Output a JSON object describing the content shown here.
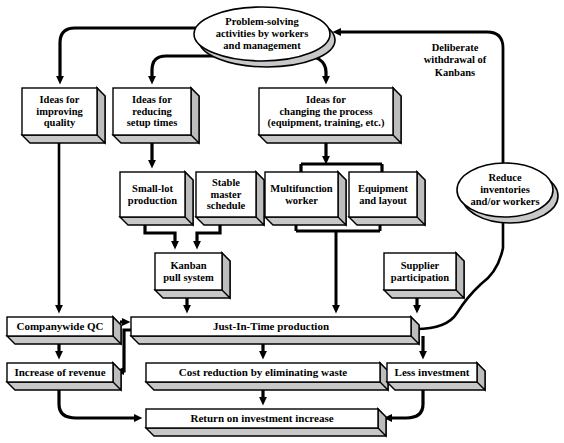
{
  "diagram": {
    "colors": {
      "stroke": "#000000",
      "face": "#ffffff",
      "shadow": "#c8c8c8",
      "shadow_dark": "#a8a8a8",
      "background": "#ffffff"
    },
    "ellipses": [
      {
        "id": "problem-solving",
        "label": "Problem-solving\nactivities by workers\nand management",
        "cx": 262,
        "cy": 34,
        "rx": 68,
        "ry": 27
      },
      {
        "id": "reduce-inventories",
        "label": "Reduce\ninventories\nand/or workers",
        "cx": 505,
        "cy": 190,
        "rx": 48,
        "ry": 27
      }
    ],
    "boxes": [
      {
        "id": "ideas-quality",
        "label": "Ideas for\nimproving\nquality",
        "x": 22,
        "y": 88,
        "w": 75,
        "h": 47
      },
      {
        "id": "ideas-setup",
        "label": "Ideas for\nreducing\nsetup times",
        "x": 113,
        "y": 88,
        "w": 78,
        "h": 47
      },
      {
        "id": "ideas-process",
        "label": "Ideas for\nchanging the process\n(equipment, training, etc.)",
        "x": 259,
        "y": 88,
        "w": 134,
        "h": 47
      },
      {
        "id": "small-lot",
        "label": "Small-lot\nproduction",
        "x": 120,
        "y": 172,
        "w": 65,
        "h": 45
      },
      {
        "id": "stable-master",
        "label": "Stable\nmaster\nschedule",
        "x": 196,
        "y": 172,
        "w": 60,
        "h": 45
      },
      {
        "id": "multifunction-worker",
        "label": "Multifunction\nworker",
        "x": 265,
        "y": 172,
        "w": 73,
        "h": 45
      },
      {
        "id": "equipment-layout",
        "label": "Equipment\nand layout",
        "x": 349,
        "y": 172,
        "w": 68,
        "h": 45
      },
      {
        "id": "kanban-pull",
        "label": "Kanban\npull system",
        "x": 155,
        "y": 253,
        "w": 67,
        "h": 37
      },
      {
        "id": "supplier-participation",
        "label": "Supplier\nparticipation",
        "x": 384,
        "y": 253,
        "w": 72,
        "h": 37
      },
      {
        "id": "companywide-qc",
        "label": "Companywide QC",
        "x": 7,
        "y": 317,
        "w": 106,
        "h": 19
      },
      {
        "id": "jit-production",
        "label": "Just-In-Time production",
        "x": 131,
        "y": 317,
        "w": 280,
        "h": 19
      },
      {
        "id": "increase-revenue",
        "label": "Increase of revenue",
        "x": 7,
        "y": 363,
        "w": 106,
        "h": 19
      },
      {
        "id": "cost-reduction",
        "label": "Cost reduction by eliminating waste",
        "x": 146,
        "y": 363,
        "w": 234,
        "h": 19
      },
      {
        "id": "less-investment",
        "label": "Less investment",
        "x": 387,
        "y": 363,
        "w": 90,
        "h": 19
      },
      {
        "id": "return-on-investment",
        "label": "Return on investment increase",
        "x": 146,
        "y": 409,
        "w": 232,
        "h": 19
      }
    ],
    "annotations": [
      {
        "id": "deliberate-withdrawal",
        "label": "Deliberate\nwithdrawal of\nKanbans",
        "x": 400,
        "y": 42,
        "w": 110
      }
    ]
  }
}
